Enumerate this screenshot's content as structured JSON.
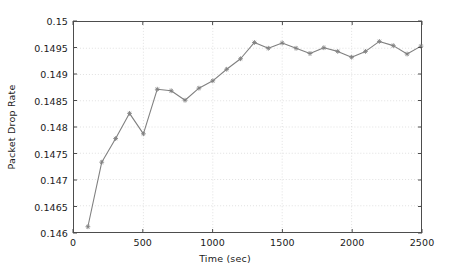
{
  "chart_data": {
    "type": "line",
    "title": "",
    "xlabel": "Time (sec)",
    "ylabel": "Packet Drop Rate",
    "xlim": [
      0,
      2500
    ],
    "ylim": [
      0.146,
      0.15
    ],
    "xticks": [
      0,
      500,
      1000,
      1500,
      2000,
      2500
    ],
    "xtick_labels": [
      "0",
      "500",
      "1000",
      "1500",
      "2000",
      "2500"
    ],
    "yticks": [
      0.146,
      0.1465,
      0.147,
      0.1475,
      0.148,
      0.1485,
      0.149,
      0.1495,
      0.15
    ],
    "ytick_labels": [
      "0.146",
      "0.1465",
      "0.147",
      "0.1475",
      "0.148",
      "0.1485",
      "0.149",
      "0.1495",
      "0.15"
    ],
    "grid": true,
    "legend": null,
    "series": [
      {
        "name": "Packet Drop Rate",
        "color": "#808080",
        "marker": "star",
        "x": [
          100,
          200,
          300,
          400,
          500,
          600,
          700,
          800,
          900,
          1000,
          1100,
          1200,
          1300,
          1400,
          1500,
          1600,
          1700,
          1800,
          1900,
          2000,
          2100,
          2200,
          2300,
          2400,
          2500
        ],
        "values": [
          0.1461,
          0.14733,
          0.14778,
          0.14826,
          0.14787,
          0.14872,
          0.14869,
          0.14851,
          0.14874,
          0.14888,
          0.1491,
          0.1493,
          0.14961,
          0.1495,
          0.1496,
          0.1495,
          0.1494,
          0.14951,
          0.14944,
          0.14933,
          0.14944,
          0.14963,
          0.14955,
          0.14939,
          0.14954
        ]
      }
    ]
  },
  "style": {
    "axis_color": "#4d4d4d",
    "grid_color": "#d9d9d9",
    "text_color": "#1a1a1a",
    "background": "#ffffff"
  }
}
